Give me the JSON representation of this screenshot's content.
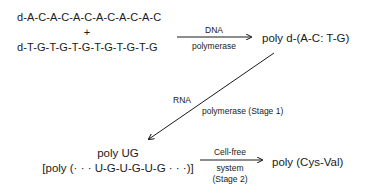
{
  "diagram": {
    "inputs": {
      "strand1": "d-A-C-A-C-A-C-A-C-A-C-A-C",
      "plus": "+",
      "strand2": "d-T-G-T-G-T-G-T-G-T-G-T-G"
    },
    "step1": {
      "enzyme_line1": "DNA",
      "enzyme_line2": "polymerase",
      "product": "poly d-(A-C: T-G)"
    },
    "step2": {
      "enzyme_line1": "RNA",
      "enzyme_line2": "polymerase (Stage 1)",
      "product_line1": "poly UG",
      "product_line2": "[poly (· · · U-G-U-G-U-G · · ·)]"
    },
    "step3": {
      "label_line1": "Cell-free",
      "label_line2": "system",
      "label_line3": "(Stage 2)",
      "product": "poly (Cys-Val)"
    },
    "colors": {
      "ink": "#1a1a1a",
      "background": "#ffffff"
    }
  }
}
